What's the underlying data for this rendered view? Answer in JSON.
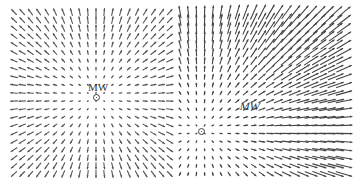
{
  "figure": {
    "type": "vector-field-panels",
    "panels": [
      {
        "name": "left",
        "label": "MW",
        "center": {
          "x": 96,
          "y": 97
        },
        "label_pos": {
          "x": 88,
          "y": 82
        },
        "grid": {
          "x0": 14,
          "x1": 170,
          "y0": 12,
          "y1": 180,
          "dx": 8.2,
          "dy": 8.1
        },
        "field": "radial",
        "scale": 0.09,
        "max_len": 7,
        "color": "#555555"
      },
      {
        "name": "right",
        "label": "MW",
        "center": {
          "x": 201,
          "y": 131
        },
        "label_pos": {
          "x": 240,
          "y": 101
        },
        "grid": {
          "x0": 180,
          "x1": 344,
          "y0": 12,
          "y1": 180,
          "dx": 8.2,
          "dy": 8.1
        },
        "field": "radial",
        "scale": 0.1,
        "max_len": 16,
        "color": "#444444"
      }
    ]
  }
}
